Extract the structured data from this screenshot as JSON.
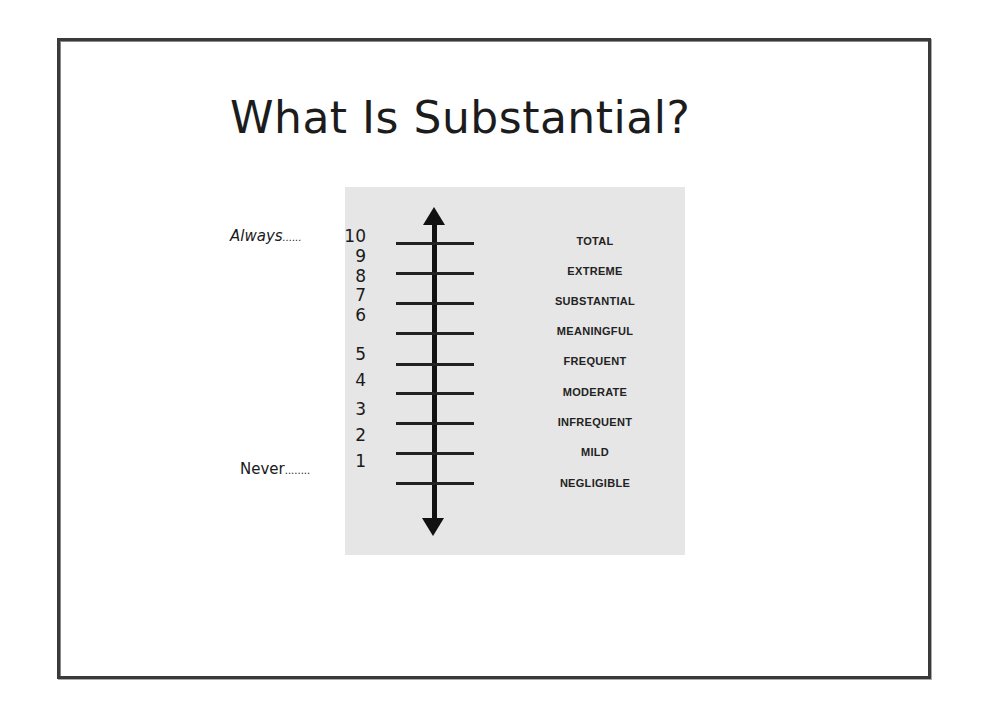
{
  "slide": {
    "title": "What Is Substantial?",
    "frame_color": "#3a3a3a",
    "panel_color": "#e6e6e6"
  },
  "scale": {
    "top_anchor": {
      "word": "Always",
      "dots": "......",
      "value": "10"
    },
    "bottom_anchor": {
      "word": "Never",
      "dots": "........",
      "value": "1"
    },
    "numbers": [
      "10",
      "9",
      "8",
      "7",
      "6",
      "5",
      "4",
      "3",
      "2",
      "1"
    ],
    "levels": [
      "TOTAL",
      "EXTREME",
      "SUBSTANTIAL",
      "MEANINGFUL",
      "FREQUENT",
      "MODERATE",
      "INFREQUENT",
      "MILD",
      "NEGLIGIBLE"
    ],
    "axis": {
      "arrow_up": "arrow-up",
      "arrow_down": "arrow-down"
    }
  }
}
